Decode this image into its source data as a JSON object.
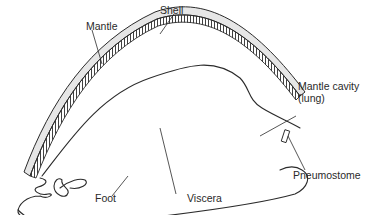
{
  "diagram": {
    "labels": {
      "shell": "Shell",
      "mantle": "Mantle",
      "mantle_cavity_line1": "Mantle cavity",
      "mantle_cavity_line2": "(lung)",
      "pneumostome": "Pneumostome",
      "viscera": "Viscera",
      "foot": "Foot"
    },
    "colors": {
      "outline": "#2b2b2b",
      "shell_fill": "#e6e6e6",
      "background": "#ffffff"
    }
  }
}
